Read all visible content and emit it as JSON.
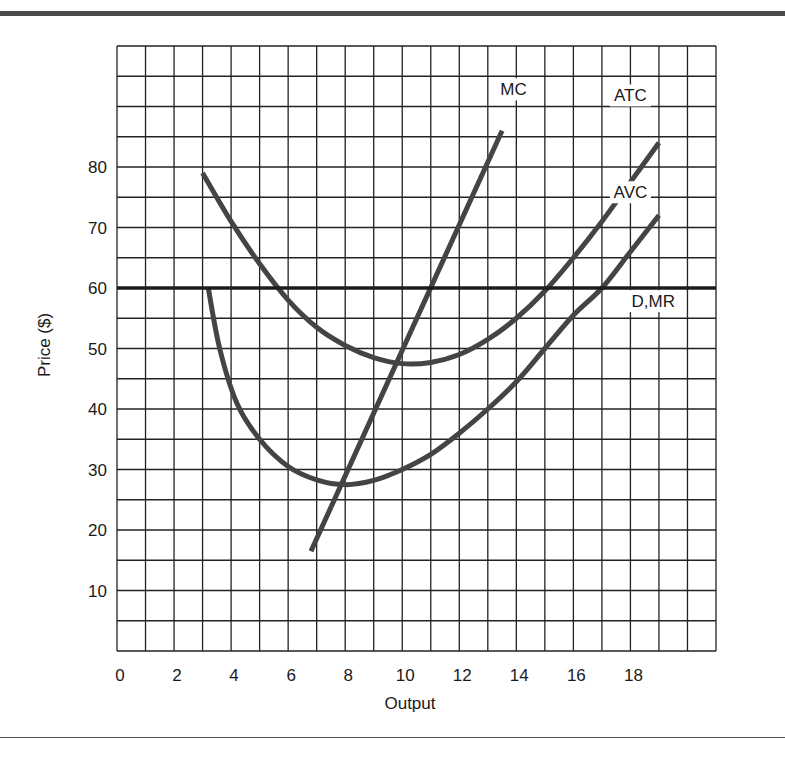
{
  "chart_data": {
    "type": "line",
    "title": "",
    "xlabel": "Output",
    "ylabel": "Price ($)",
    "xlim": [
      0,
      21
    ],
    "ylim": [
      0,
      100
    ],
    "grid": true,
    "x_ticks": [
      "0",
      "2",
      "4",
      "6",
      "8",
      "10",
      "12",
      "14",
      "16",
      "18"
    ],
    "y_ticks": [
      "10",
      "20",
      "30",
      "40",
      "50",
      "60",
      "70",
      "80"
    ],
    "series": [
      {
        "name": "MC",
        "points": [
          [
            6.8,
            16.5
          ],
          [
            13.5,
            86
          ]
        ]
      },
      {
        "name": "ATC",
        "points": [
          [
            3,
            79
          ],
          [
            4,
            71
          ],
          [
            5,
            64
          ],
          [
            6,
            58
          ],
          [
            7,
            53.5
          ],
          [
            8,
            50.5
          ],
          [
            9,
            48.5
          ],
          [
            10,
            47.5
          ],
          [
            11,
            47.7
          ],
          [
            12,
            49
          ],
          [
            13,
            51.5
          ],
          [
            14,
            55
          ],
          [
            15,
            59.5
          ],
          [
            16,
            65
          ],
          [
            17,
            71
          ],
          [
            18,
            77.5
          ],
          [
            19,
            84
          ]
        ]
      },
      {
        "name": "AVC",
        "points": [
          [
            3.2,
            60
          ],
          [
            3.6,
            50
          ],
          [
            4.2,
            41
          ],
          [
            5,
            35
          ],
          [
            6,
            30.5
          ],
          [
            7,
            28.3
          ],
          [
            8,
            27.5
          ],
          [
            9,
            28.2
          ],
          [
            10,
            30
          ],
          [
            11,
            32.5
          ],
          [
            12,
            36
          ],
          [
            13,
            40
          ],
          [
            14,
            44.5
          ],
          [
            15,
            50
          ],
          [
            16,
            55.5
          ],
          [
            17,
            60
          ],
          [
            18,
            66
          ],
          [
            19,
            72
          ]
        ]
      },
      {
        "name": "D,MR",
        "points": [
          [
            0,
            60
          ],
          [
            21,
            60
          ]
        ]
      }
    ],
    "labels": [
      {
        "text": "MC",
        "x": 13.9,
        "y": 92
      },
      {
        "text": "ATC",
        "x": 18.0,
        "y": 91
      },
      {
        "text": "AVC",
        "x": 18.0,
        "y": 75
      },
      {
        "text": "D,MR",
        "x": 18.8,
        "y": 57
      }
    ]
  },
  "axis": {
    "xlabel": "Output",
    "ylabel": "Price ($)"
  }
}
